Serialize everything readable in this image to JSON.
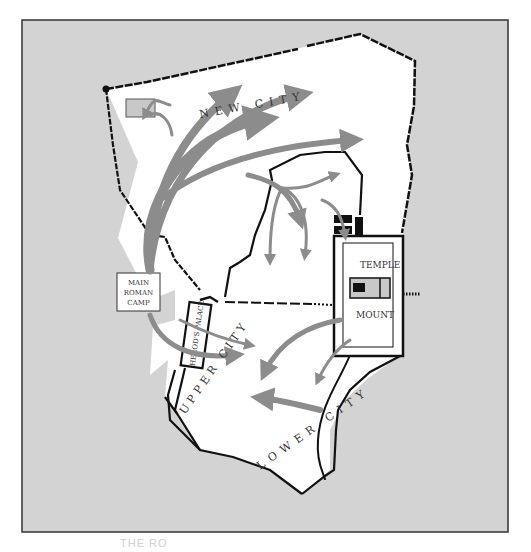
{
  "map": {
    "colors": {
      "background_outside": "#d3d3d3",
      "city_fill": "#ffffff",
      "wall": "#111111",
      "arrow": "#8c8c8c",
      "frame": "#333333"
    },
    "labels": {
      "new_city": "NEW CITY",
      "upper_city": "UPPER CITY",
      "lower_city": "LOWER CITY",
      "temple": "TEMPLE",
      "mount": "MOUNT",
      "main_roman_camp_line1": "MAIN",
      "main_roman_camp_line2": "ROMAN",
      "main_roman_camp_line3": "CAMP",
      "herods_palace": "HEROD'S PALACE"
    }
  },
  "caption": {
    "text": "THE RO"
  }
}
